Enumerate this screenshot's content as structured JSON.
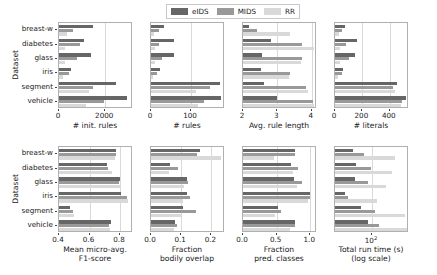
{
  "figure": {
    "datasets": [
      "breast-w",
      "diabetes",
      "glass",
      "iris",
      "segment",
      "vehicle"
    ],
    "ylabel": "Dataset",
    "series_order": [
      "eIDS",
      "MIDS",
      "RR"
    ],
    "colors": {
      "eIDS": "#666666",
      "MIDS": "#999999",
      "RR": "#d9d9d9"
    }
  },
  "legend": {
    "position": "upper-center",
    "entries": [
      {
        "label": "eIDS",
        "color": "#666666",
        "icon": "bar-swatch"
      },
      {
        "label": "MIDS",
        "color": "#999999",
        "icon": "bar-swatch"
      },
      {
        "label": "RR",
        "color": "#d9d9d9",
        "icon": "bar-swatch"
      }
    ]
  },
  "chart_data": [
    {
      "type": "bar",
      "orientation": "horizontal",
      "panel_index": 0,
      "title": "",
      "xlabel": "# init. rules",
      "ylabel": "Dataset",
      "categories": [
        "breast-w",
        "diabetes",
        "glass",
        "iris",
        "segment",
        "vehicle"
      ],
      "xlim": [
        0,
        3200
      ],
      "xticks": [
        0,
        2000
      ],
      "xticklabels": [
        "0",
        "2000"
      ],
      "grid": "x-only",
      "log_scale": false,
      "series": [
        {
          "name": "eIDS",
          "values": [
            1450,
            1100,
            1380,
            520,
            2450,
            2950
          ]
        },
        {
          "name": "MIDS",
          "values": [
            620,
            900,
            780,
            420,
            1450,
            1950
          ]
        },
        {
          "name": "RR",
          "values": [
            330,
            270,
            240,
            180,
            1280,
            1150
          ]
        }
      ]
    },
    {
      "type": "bar",
      "orientation": "horizontal",
      "panel_index": 1,
      "title": "",
      "xlabel": "# rules",
      "ylabel": "Dataset",
      "categories": [
        "breast-w",
        "diabetes",
        "glass",
        "iris",
        "segment",
        "vehicle"
      ],
      "xlim": [
        0,
        185
      ],
      "xticks": [
        0,
        100
      ],
      "xticklabels": [
        "0",
        "100"
      ],
      "grid": "x-only",
      "log_scale": false,
      "series": [
        {
          "name": "eIDS",
          "values": [
            33,
            58,
            57,
            23,
            172,
            174
          ]
        },
        {
          "name": "MIDS",
          "values": [
            20,
            21,
            28,
            15,
            148,
            132
          ]
        },
        {
          "name": "RR",
          "values": [
            8,
            9,
            10,
            6,
            112,
            118
          ]
        }
      ]
    },
    {
      "type": "bar",
      "orientation": "horizontal",
      "panel_index": 2,
      "title": "",
      "xlabel": "Avg. rule length",
      "ylabel": "Dataset",
      "categories": [
        "breast-w",
        "diabetes",
        "glass",
        "iris",
        "segment",
        "vehicle"
      ],
      "xlim": [
        2,
        4.15
      ],
      "xticks": [
        2,
        3,
        4
      ],
      "xticklabels": [
        "2",
        "3",
        "4"
      ],
      "grid": "x-only",
      "log_scale": false,
      "series": [
        {
          "name": "eIDS",
          "values": [
            2.18,
            2.8,
            2.55,
            2.52,
            2.62,
            2.98
          ]
        },
        {
          "name": "MIDS",
          "values": [
            2.4,
            3.7,
            3.7,
            3.37,
            3.82,
            4.02
          ]
        },
        {
          "name": "RR",
          "values": [
            3.38,
            4.05,
            3.68,
            3.33,
            3.88,
            4.06
          ]
        }
      ]
    },
    {
      "type": "bar",
      "orientation": "horizontal",
      "panel_index": 3,
      "title": "",
      "xlabel": "# literals",
      "ylabel": "Dataset",
      "categories": [
        "breast-w",
        "diabetes",
        "glass",
        "iris",
        "segment",
        "vehicle"
      ],
      "xlim": [
        0,
        540
      ],
      "xticks": [
        0,
        200,
        400
      ],
      "xticklabels": [
        "0",
        "200",
        "400"
      ],
      "grid": "x-only",
      "log_scale": false,
      "series": [
        {
          "name": "eIDS",
          "values": [
            72,
            163,
            146,
            58,
            452,
            518
          ]
        },
        {
          "name": "MIDS",
          "values": [
            48,
            78,
            103,
            50,
            425,
            490
          ]
        },
        {
          "name": "RR",
          "values": [
            28,
            36,
            38,
            20,
            436,
            480
          ]
        }
      ]
    },
    {
      "type": "bar",
      "orientation": "horizontal",
      "panel_index": 4,
      "title": "",
      "xlabel": "Mean micro-avg.\nF1-score",
      "ylabel": "Dataset",
      "categories": [
        "breast-w",
        "diabetes",
        "glass",
        "iris",
        "segment",
        "vehicle"
      ],
      "xlim": [
        0.4,
        0.885
      ],
      "xticks": [
        0.4,
        0.6,
        0.8
      ],
      "xticklabels": [
        "0.4",
        "0.6",
        "0.8"
      ],
      "grid": "x-only",
      "log_scale": false,
      "series": [
        {
          "name": "eIDS",
          "values": [
            0.775,
            0.715,
            0.8,
            0.805,
            0.47,
            0.74
          ]
        },
        {
          "name": "MIDS",
          "values": [
            0.775,
            0.72,
            0.79,
            0.845,
            0.49,
            0.73
          ]
        },
        {
          "name": "RR",
          "values": [
            0.77,
            0.745,
            0.8,
            0.855,
            0.5,
            0.735
          ]
        }
      ]
    },
    {
      "type": "bar",
      "orientation": "horizontal",
      "panel_index": 5,
      "title": "",
      "xlabel": "Fraction\nbodily overlap",
      "ylabel": "Dataset",
      "categories": [
        "breast-w",
        "diabetes",
        "glass",
        "iris",
        "segment",
        "vehicle"
      ],
      "xlim": [
        0.0,
        0.245
      ],
      "xticks": [
        0.0,
        0.1,
        0.2
      ],
      "xticklabels": [
        "0.0",
        "0.1",
        "0.2"
      ],
      "grid": "x-only",
      "log_scale": false,
      "series": [
        {
          "name": "eIDS",
          "values": [
            0.162,
            0.062,
            0.118,
            0.118,
            0.105,
            0.08
          ]
        },
        {
          "name": "MIDS",
          "values": [
            0.152,
            0.088,
            0.122,
            0.13,
            0.148,
            0.085
          ]
        },
        {
          "name": "RR",
          "values": [
            0.232,
            0.06,
            0.108,
            0.105,
            0.098,
            0.075
          ]
        }
      ]
    },
    {
      "type": "bar",
      "orientation": "horizontal",
      "panel_index": 6,
      "title": "",
      "xlabel": "Fraction\npred. classes",
      "ylabel": "Dataset",
      "categories": [
        "breast-w",
        "diabetes",
        "glass",
        "iris",
        "segment",
        "vehicle"
      ],
      "xlim": [
        0.0,
        1.1
      ],
      "xticks": [
        0.0,
        0.5,
        1.0
      ],
      "xticklabels": [
        "0.0",
        "0.5",
        "1.0"
      ],
      "grid": "x-only",
      "log_scale": false,
      "series": [
        {
          "name": "eIDS",
          "values": [
            0.78,
            0.72,
            0.76,
            0.99,
            0.52,
            0.78
          ]
        },
        {
          "name": "MIDS",
          "values": [
            0.78,
            0.82,
            0.88,
            0.99,
            0.56,
            0.77
          ]
        },
        {
          "name": "RR",
          "values": [
            0.46,
            0.74,
            0.8,
            0.97,
            0.48,
            0.7
          ]
        }
      ]
    },
    {
      "type": "bar",
      "orientation": "horizontal",
      "panel_index": 7,
      "title": "",
      "xlabel": "Total run time (s)\n(log scale)",
      "ylabel": "Dataset",
      "categories": [
        "breast-w",
        "diabetes",
        "glass",
        "iris",
        "segment",
        "vehicle"
      ],
      "xlim_log10": [
        0.7,
        3.3
      ],
      "xticks": [
        100
      ],
      "xticklabels": [
        "10²"
      ],
      "grid": "x-only",
      "log_scale": true,
      "series": [
        {
          "name": "eIDS",
          "values": [
            22,
            28,
            25,
            11,
            42,
            75
          ]
        },
        {
          "name": "MIDS",
          "values": [
            52,
            95,
            70,
            14,
            130,
            180
          ]
        },
        {
          "name": "RR",
          "values": [
            620,
            520,
            300,
            150,
            1500,
            1700
          ]
        }
      ]
    }
  ]
}
